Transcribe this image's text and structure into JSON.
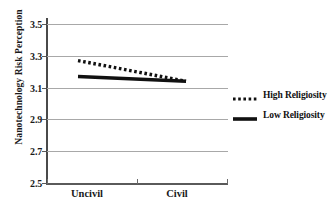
{
  "chart_data": {
    "type": "line",
    "title": "",
    "xlabel": "",
    "ylabel": "Nanotechnology Risk Perception",
    "categories": [
      "Uncivil",
      "Civil"
    ],
    "x": [
      0,
      1
    ],
    "ylim": [
      2.5,
      3.5
    ],
    "yticks": [
      "2.5",
      "2.7",
      "2.9",
      "3.1",
      "3.3",
      "3.5"
    ],
    "ytick_values": [
      2.5,
      2.7,
      2.9,
      3.1,
      3.3,
      3.5
    ],
    "grid": true,
    "legend_position": "right",
    "series": [
      {
        "name": "High Religiosity",
        "style": "dotted",
        "color": "#111111",
        "values": [
          3.27,
          3.14
        ]
      },
      {
        "name": "Low Religiosity",
        "style": "solid",
        "color": "#111111",
        "values": [
          3.17,
          3.14
        ]
      }
    ]
  },
  "axes": {
    "y_title": "Nanotechnology Risk Perception",
    "y_labels": {
      "t0": "2.5",
      "t1": "2.7",
      "t2": "2.9",
      "t3": "3.1",
      "t4": "3.3",
      "t5": "3.5"
    },
    "x_labels": {
      "c0": "Uncivil",
      "c1": "Civil"
    }
  },
  "legend": {
    "entries": [
      {
        "label": "High Religiosity",
        "style": "dotted"
      },
      {
        "label": "Low Religiosity",
        "style": "solid"
      }
    ]
  },
  "colors": {
    "series": "#111111",
    "gridline": "#a8a8a8",
    "axis": "#4a4a4a",
    "text": "#1a1a1a",
    "background": "#ffffff"
  }
}
